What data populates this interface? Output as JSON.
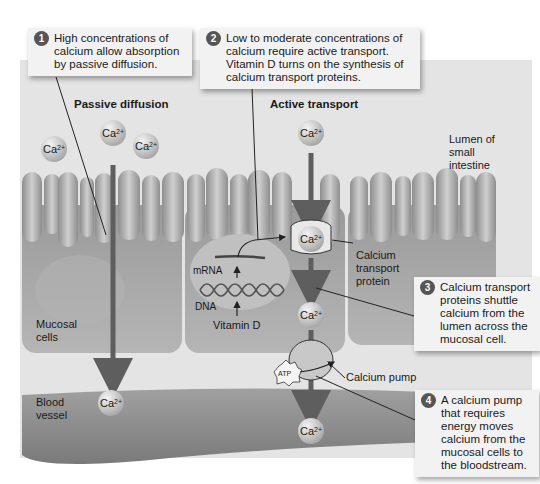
{
  "sections": {
    "passive": "Passive diffusion",
    "active": "Active transport"
  },
  "callouts": [
    {
      "number": "1",
      "text": "High concentrations of calcium allow absorption by passive diffusion."
    },
    {
      "number": "2",
      "text": "Low to moderate concentrations of calcium require active transport. Vitamin D turns on the synthesis of calcium transport proteins."
    },
    {
      "number": "3",
      "text": "Calcium transport proteins shuttle calcium from the lumen across the mucosal cell."
    },
    {
      "number": "4",
      "text": "A calcium pump that requires energy moves calcium from the mucosal cells to the bloodstream."
    }
  ],
  "labels": {
    "lumen": "Lumen of small intestine",
    "mucosal_cells": "Mucosal cells",
    "blood_vessel": "Blood vessel",
    "mrna": "mRNA",
    "dna": "DNA",
    "vitamin_d": "Vitamin D",
    "transport_protein": "Calcium transport protein",
    "calcium_pump": "Calcium pump",
    "atp": "ATP"
  },
  "ion": {
    "symbol": "Ca",
    "charge": "2+"
  },
  "colors": {
    "background_panel": "#e4e4e4",
    "cell": "#a9a9a9",
    "arrow": "#5e5e5e",
    "blood_vessel": "#8c8c8c",
    "callout_bg": "#f2f2f2",
    "badge": "#555555"
  }
}
